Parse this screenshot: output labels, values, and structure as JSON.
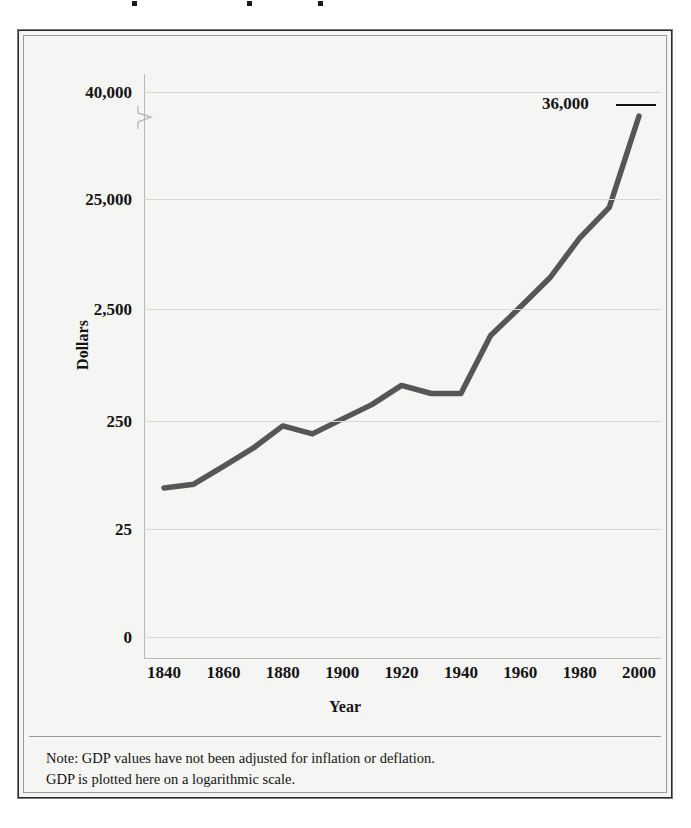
{
  "figure": {
    "note_lines": [
      "Note: GDP values have not been adjusted for inflation or deflation.",
      "GDP is plotted here on a logarithmic scale."
    ],
    "endpoint_label": "36,000"
  },
  "chart_data": {
    "type": "line",
    "title": "",
    "xlabel": "Year",
    "ylabel": "Dollars",
    "scale": "logarithmic",
    "grid": true,
    "legend": "none",
    "axis_break": true,
    "xlim": [
      1840,
      2000
    ],
    "ylim": [
      0,
      40000
    ],
    "x_ticks": [
      "1840",
      "1860",
      "1880",
      "1900",
      "1920",
      "1940",
      "1960",
      "1980",
      "2000"
    ],
    "y_ticks": [
      "40,000",
      "25,000",
      "2,500",
      "250",
      "25",
      "0"
    ],
    "x": [
      1840,
      1850,
      1860,
      1870,
      1880,
      1890,
      1900,
      1910,
      1920,
      1930,
      1940,
      1950,
      1960,
      1970,
      1980,
      1990,
      2000
    ],
    "values": [
      60,
      65,
      95,
      140,
      225,
      190,
      260,
      350,
      520,
      440,
      440,
      1450,
      2600,
      4800,
      11000,
      21000,
      36000
    ],
    "series": [
      {
        "name": "GDP per capita",
        "values": [
          60,
          65,
          95,
          140,
          225,
          190,
          260,
          350,
          520,
          440,
          440,
          1450,
          2600,
          4800,
          11000,
          21000,
          36000
        ]
      }
    ],
    "annotations": [
      {
        "label": "36,000",
        "x": 2000,
        "y": 36000
      }
    ],
    "line_color": "#565656",
    "grid_color": "#d8d8d4",
    "plot_background": "#f5f5f3"
  },
  "geometry": {
    "y_gridlines_px": [
      18,
      125,
      235,
      347,
      455,
      563
    ],
    "title_dots_px": [
      132,
      247,
      318
    ]
  }
}
